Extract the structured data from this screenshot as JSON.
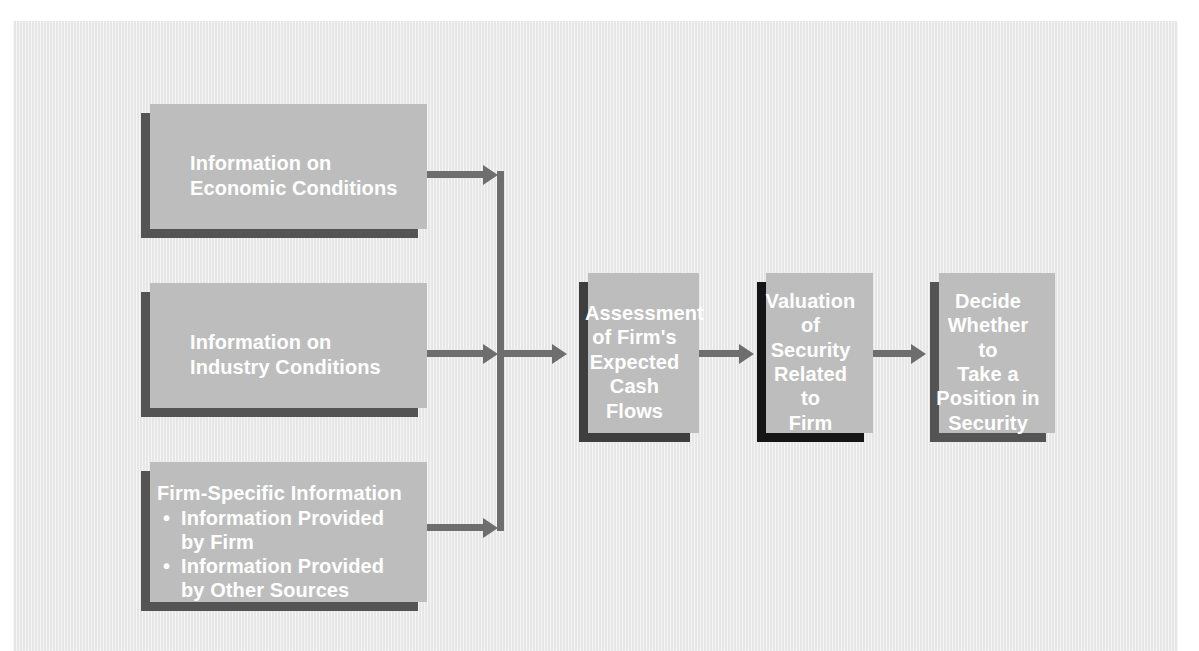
{
  "figure": {
    "panel_color": "#e9e9e9"
  },
  "colors": {
    "box_gray": "#545454",
    "box_dark": "#3e3e3e",
    "box_black": "#151515",
    "shadow_plate": "#bdbdbd",
    "connector": "#6e6e6e",
    "text": "#ffffff"
  },
  "inputs": [
    {
      "id": "economic-conditions",
      "line1": "Information on",
      "line2": "Economic Conditions"
    },
    {
      "id": "industry-conditions",
      "line1": "Information on",
      "line2": "Industry Conditions"
    },
    {
      "id": "firm-specific",
      "heading": "Firm-Specific Information",
      "bullets": [
        "Information Provided by Firm",
        "Information Provided by Other Sources"
      ]
    }
  ],
  "chain": [
    {
      "id": "assessment",
      "lines": [
        "Assessment",
        "of Firm's",
        "Expected",
        "Cash",
        "Flows"
      ],
      "shade": "dark"
    },
    {
      "id": "valuation",
      "lines": [
        "Valuation",
        "of",
        "Security",
        "Related to",
        "Firm"
      ],
      "shade": "black"
    },
    {
      "id": "decision",
      "lines": [
        "Decide",
        "Whether to",
        "Take a",
        "Position in",
        "Security"
      ],
      "shade": "gray"
    }
  ],
  "connectors": {
    "bus_label": "input-merge-bus",
    "arrow_labels": [
      "arrow-economic-to-bus",
      "arrow-industry-to-bus",
      "arrow-firm-to-bus",
      "arrow-bus-to-assessment",
      "arrow-assessment-to-valuation",
      "arrow-valuation-to-decision"
    ]
  }
}
